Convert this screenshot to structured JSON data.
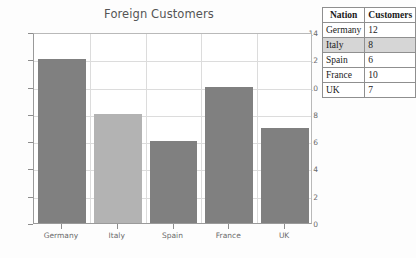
{
  "chart_data": {
    "type": "bar",
    "title": "Foreign Customers",
    "xlabel": "",
    "ylabel": "",
    "categories": [
      "Germany",
      "Italy",
      "Spain",
      "France",
      "UK"
    ],
    "values": [
      12,
      8,
      6,
      10,
      7
    ],
    "ylim": [
      0,
      14
    ],
    "ytick_values": [
      0,
      2,
      4,
      6,
      8,
      10,
      12,
      14
    ],
    "ytick_labels": [
      "0",
      "2",
      "4",
      "6",
      "8",
      "10",
      "12",
      "14"
    ],
    "grid": true,
    "legend": "none",
    "bar_colors": [
      "#808080",
      "#b3b3b3",
      "#808080",
      "#808080",
      "#808080"
    ],
    "highlighted_category": "Italy"
  },
  "table": {
    "headers": [
      "Nation",
      "Customers"
    ],
    "rows": [
      {
        "nation": "Germany",
        "customers": "12",
        "highlighted": false
      },
      {
        "nation": "Italy",
        "customers": "8",
        "highlighted": true
      },
      {
        "nation": "Spain",
        "customers": "6",
        "highlighted": false
      },
      {
        "nation": "France",
        "customers": "10",
        "highlighted": false
      },
      {
        "nation": "UK",
        "customers": "7",
        "highlighted": false
      }
    ]
  },
  "colors": {
    "bar_default": "#808080",
    "bar_highlight": "#b3b3b3",
    "grid": "#dcdcdc",
    "axis": "#9a9a9a",
    "title_text": "#555555",
    "tick_text": "#6b6b6b",
    "table_border": "#8f8f8f",
    "row_highlight": "#d6d6d6",
    "background": "#fdfdfd"
  }
}
